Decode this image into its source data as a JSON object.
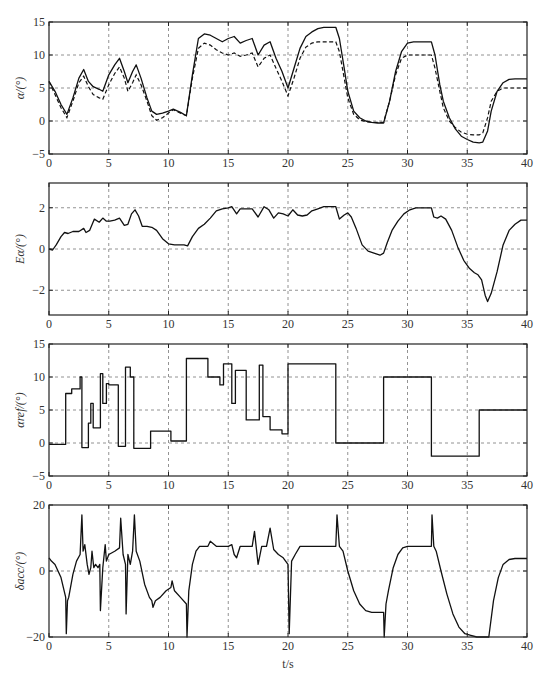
{
  "chart_data": [
    {
      "type": "line",
      "ylabel": "α/(°)",
      "xlabel": "",
      "xlim": [
        0,
        40
      ],
      "ylim": [
        -5,
        15
      ],
      "xticks": [
        0,
        5,
        10,
        15,
        20,
        25,
        30,
        35,
        40
      ],
      "yticks": [
        -5,
        0,
        5,
        10,
        15
      ],
      "grid": true,
      "series": [
        {
          "name": "alpha (actual)",
          "style": "solid",
          "x": [
            0,
            0.5,
            1,
            1.5,
            2,
            2.5,
            2.9,
            3.3,
            3.7,
            4.2,
            4.5,
            5,
            5.5,
            5.9,
            6.3,
            6.6,
            7,
            7.3,
            7.7,
            8.2,
            8.6,
            9,
            9.5,
            10,
            10.4,
            11,
            11.5,
            12,
            12.5,
            13,
            13.5,
            14,
            14.5,
            15,
            15.5,
            16,
            16.5,
            17,
            17.5,
            18,
            18.5,
            19,
            19.5,
            20,
            20.5,
            21,
            21.5,
            22,
            22.5,
            23,
            24,
            24.3,
            24.7,
            25,
            25.5,
            26,
            26.5,
            27,
            27.5,
            28,
            28.5,
            29,
            29.5,
            30,
            30.5,
            31,
            32,
            32.3,
            32.7,
            33,
            33.5,
            34,
            34.5,
            35,
            35.5,
            36,
            36.3,
            36.7,
            37,
            37.5,
            38,
            38.5,
            39,
            40
          ],
          "y": [
            6,
            4.5,
            2.5,
            1.0,
            3.5,
            6.5,
            7.8,
            6.0,
            5.2,
            4.8,
            4.5,
            7.0,
            8.5,
            9.5,
            7.5,
            5.8,
            7.5,
            8.5,
            6.5,
            3.5,
            1.5,
            1.0,
            1.2,
            1.5,
            1.8,
            1.3,
            0.8,
            7.0,
            12.5,
            13.2,
            13.0,
            12.5,
            12.0,
            12.5,
            12.8,
            11.8,
            12.2,
            12.5,
            10.0,
            11.5,
            12.0,
            9.5,
            7.5,
            5.0,
            8.0,
            11.0,
            12.8,
            13.5,
            14.0,
            14.2,
            14.2,
            12.5,
            8.0,
            4.5,
            1.5,
            0.5,
            0.0,
            -0.2,
            -0.3,
            -0.3,
            3.0,
            7.5,
            10.5,
            11.8,
            12.0,
            12.0,
            12.0,
            10.0,
            5.5,
            3.0,
            0.5,
            -1.2,
            -2.3,
            -2.8,
            -3.2,
            -3.3,
            -3.2,
            -1.5,
            1.5,
            4.5,
            5.8,
            6.3,
            6.4,
            6.4
          ]
        },
        {
          "name": "alpha (reference/model)",
          "style": "dashed",
          "x": [
            0,
            0.5,
            1,
            1.5,
            2,
            2.5,
            2.9,
            3.3,
            3.7,
            4.2,
            4.5,
            5,
            5.5,
            5.9,
            6.3,
            6.6,
            7,
            7.3,
            7.7,
            8.2,
            8.6,
            9,
            9.5,
            10,
            10.4,
            11,
            11.5,
            12,
            12.5,
            13,
            13.5,
            14,
            14.5,
            15,
            15.5,
            16,
            16.5,
            17,
            17.5,
            18,
            18.5,
            19,
            19.5,
            20,
            20.5,
            21,
            21.5,
            22,
            22.5,
            23,
            24,
            24.3,
            24.7,
            25,
            25.5,
            26,
            26.5,
            27,
            27.5,
            28,
            28.5,
            29,
            29.5,
            30,
            30.5,
            31,
            32,
            32.3,
            32.7,
            33,
            33.5,
            34,
            34.5,
            35,
            35.5,
            36,
            36.3,
            36.7,
            37,
            37.5,
            38,
            38.5,
            39,
            40
          ],
          "y": [
            6,
            4.0,
            2.0,
            0.5,
            3.0,
            5.8,
            6.8,
            5.2,
            4.0,
            3.5,
            3.3,
            5.5,
            7.2,
            8.2,
            6.5,
            4.5,
            5.8,
            7.0,
            5.5,
            3.0,
            0.8,
            0.1,
            0.5,
            1.2,
            1.7,
            1.2,
            0.8,
            6.5,
            11.0,
            11.8,
            11.5,
            10.8,
            10.3,
            10.0,
            10.3,
            9.8,
            10.0,
            10.3,
            8.2,
            9.5,
            10.0,
            8.0,
            6.0,
            3.8,
            6.5,
            9.5,
            11.2,
            11.8,
            12.0,
            12.0,
            12.0,
            10.5,
            6.5,
            3.5,
            1.0,
            0.2,
            -0.1,
            -0.2,
            -0.2,
            -0.2,
            3.0,
            7.0,
            9.5,
            10.0,
            10.0,
            10.0,
            10.0,
            8.0,
            4.5,
            2.0,
            0.0,
            -1.0,
            -1.7,
            -2.0,
            -2.1,
            -2.1,
            -1.8,
            0.5,
            3.0,
            4.5,
            5.0,
            5.0,
            5.0,
            5.0
          ]
        }
      ]
    },
    {
      "type": "line",
      "ylabel": "Eα/(°)",
      "xlabel": "",
      "xlim": [
        0,
        40
      ],
      "ylim": [
        -3.2,
        3.2
      ],
      "xticks": [
        0,
        5,
        10,
        15,
        20,
        25,
        30,
        35,
        40
      ],
      "yticks": [
        -2,
        0,
        2
      ],
      "grid": true,
      "series": [
        {
          "name": "alpha error",
          "style": "solid",
          "x": [
            0,
            0.3,
            0.6,
            1,
            1.3,
            1.6,
            2,
            2.5,
            2.9,
            3.1,
            3.4,
            3.8,
            4.2,
            4.5,
            4.8,
            5.1,
            5.5,
            5.9,
            6.3,
            6.6,
            6.9,
            7.2,
            7.5,
            7.8,
            8.2,
            8.6,
            9,
            9.5,
            10,
            10.5,
            11,
            11.3,
            11.6,
            12,
            12.5,
            13,
            13.5,
            14,
            14.5,
            15,
            15.3,
            15.7,
            16,
            16.5,
            17,
            17.5,
            18,
            18.4,
            18.8,
            19.2,
            19.6,
            20,
            20.4,
            20.8,
            21.2,
            21.6,
            22,
            22.5,
            23,
            23.5,
            24,
            24.3,
            24.7,
            25,
            25.3,
            25.7,
            26.2,
            26.7,
            27.2,
            27.7,
            28,
            28.3,
            28.7,
            29.2,
            29.7,
            30.2,
            30.7,
            31.3,
            32,
            32.2,
            32.5,
            32.8,
            33.2,
            33.7,
            34.2,
            34.7,
            35.2,
            35.6,
            35.9,
            36.2,
            36.5,
            36.7,
            37,
            37.5,
            38,
            38.5,
            39,
            39.5,
            40
          ],
          "y": [
            0.0,
            -0.05,
            0.2,
            0.6,
            0.8,
            0.75,
            0.85,
            0.85,
            1.0,
            0.8,
            0.9,
            1.45,
            1.3,
            1.5,
            1.35,
            1.35,
            1.4,
            1.5,
            1.15,
            1.2,
            1.7,
            1.9,
            1.6,
            1.1,
            1.1,
            1.05,
            0.9,
            0.5,
            0.25,
            0.2,
            0.2,
            0.2,
            0.15,
            0.6,
            1.0,
            1.2,
            1.5,
            1.85,
            1.95,
            2.0,
            2.05,
            1.7,
            1.95,
            1.95,
            1.95,
            1.55,
            2.05,
            1.9,
            1.5,
            1.75,
            1.7,
            1.6,
            1.9,
            1.65,
            1.6,
            1.65,
            1.85,
            1.95,
            2.05,
            2.05,
            2.05,
            1.45,
            1.65,
            1.75,
            1.55,
            1.0,
            0.2,
            -0.1,
            -0.2,
            -0.3,
            -0.2,
            0.3,
            0.9,
            1.35,
            1.7,
            1.9,
            2.0,
            2.0,
            2.0,
            1.55,
            1.5,
            1.6,
            1.45,
            0.9,
            0.1,
            -0.55,
            -0.95,
            -1.15,
            -1.25,
            -1.5,
            -2.25,
            -2.55,
            -2.15,
            -1.1,
            0.2,
            0.9,
            1.2,
            1.4,
            1.4
          ]
        }
      ]
    },
    {
      "type": "line",
      "step": true,
      "ylabel": "αref/(°)",
      "xlabel": "",
      "xlim": [
        0,
        40
      ],
      "ylim": [
        -5,
        15
      ],
      "xticks": [
        0,
        5,
        10,
        15,
        20,
        25,
        30,
        35,
        40
      ],
      "yticks": [
        -5,
        0,
        5,
        10,
        15
      ],
      "grid": true,
      "series": [
        {
          "name": "alpha reference",
          "style": "solid-step",
          "x": [
            0,
            1.4,
            1.9,
            2.6,
            2.75,
            3.3,
            3.5,
            3.7,
            4.3,
            4.5,
            4.8,
            5,
            5.8,
            6.4,
            6.8,
            7.1,
            8.5,
            10.2,
            11.5,
            13.3,
            14.3,
            14.6,
            15.3,
            15.6,
            16.5,
            17.6,
            17.9,
            18.5,
            19.5,
            20,
            24,
            28,
            32,
            36,
            40
          ],
          "y": [
            -0.2,
            7.5,
            8.2,
            10.0,
            -0.7,
            3.0,
            6.0,
            2.3,
            10.5,
            6.0,
            9.0,
            8.8,
            -0.5,
            11.5,
            10.0,
            -0.8,
            1.8,
            0.3,
            12.8,
            10.0,
            8.8,
            12.0,
            6.0,
            11.0,
            3.5,
            11.8,
            4.0,
            2.0,
            1.4,
            12.0,
            0.0,
            10.0,
            -2.0,
            5.0,
            5.0
          ]
        }
      ]
    },
    {
      "type": "line",
      "ylabel": "δacc/(°)",
      "xlabel": "t/s",
      "xlim": [
        0,
        40
      ],
      "ylim": [
        -20,
        20
      ],
      "xticks": [
        0,
        5,
        10,
        15,
        20,
        25,
        30,
        35,
        40
      ],
      "yticks": [
        -20,
        0,
        20
      ],
      "grid": true,
      "series": [
        {
          "name": "control deflection",
          "style": "solid",
          "x": [
            0,
            0.2,
            0.5,
            1,
            1.4,
            1.45,
            1.55,
            1.65,
            2,
            2.3,
            2.6,
            2.75,
            2.85,
            3,
            3.2,
            3.35,
            3.5,
            3.6,
            3.75,
            3.9,
            4.1,
            4.25,
            4.3,
            4.5,
            4.7,
            4.8,
            5,
            5.5,
            5.9,
            6.0,
            6.2,
            6.4,
            6.45,
            6.6,
            6.8,
            7.0,
            7.15,
            7.3,
            7.6,
            8.0,
            8.4,
            8.6,
            8.7,
            8.9,
            9.3,
            9.8,
            10.2,
            10.3,
            10.5,
            11.0,
            11.5,
            11.55,
            11.7,
            12.0,
            12.3,
            12.6,
            13,
            13.3,
            13.5,
            14.0,
            14.5,
            15.0,
            15.3,
            15.5,
            15.7,
            16.0,
            16.5,
            17.0,
            17.2,
            17.5,
            17.8,
            18.2,
            18.5,
            18.8,
            19.2,
            19.6,
            20.0,
            20.1,
            20.3,
            20.6,
            21.0,
            21.5,
            22.0,
            23.0,
            24.0,
            24.1,
            24.3,
            24.6,
            25.0,
            25.5,
            26.0,
            26.5,
            27.0,
            27.5,
            28.0,
            28.05,
            28.2,
            28.4,
            28.8,
            29.2,
            29.6,
            30.0,
            31.0,
            32.0,
            32.05,
            32.2,
            32.4,
            32.8,
            33.3,
            33.8,
            34.3,
            34.8,
            35.3,
            35.8,
            36.2,
            36.5,
            36.8,
            37.2,
            37.6,
            38.0,
            38.5,
            39.0,
            40.0
          ],
          "y": [
            4,
            3,
            2,
            -2,
            -8,
            -19,
            -9,
            -8,
            -1,
            3,
            5,
            17,
            6,
            8,
            2,
            -1,
            1,
            6,
            1,
            2,
            1,
            2,
            -12,
            1,
            8,
            3,
            5,
            6,
            7,
            16,
            5,
            2,
            -13,
            5,
            2,
            6,
            17,
            6,
            3,
            -4,
            -8,
            -9,
            -11,
            -9,
            -8,
            -6,
            -5,
            -3,
            -6,
            -8,
            -10,
            -20,
            -6,
            2,
            6,
            7.5,
            7.5,
            7.5,
            9,
            7.5,
            7.5,
            7.5,
            8,
            5,
            4,
            7.5,
            7.5,
            7.5,
            12,
            2,
            7.5,
            7.5,
            13,
            6.5,
            5,
            4,
            2,
            -19,
            3,
            5,
            7.5,
            7.5,
            7.5,
            7.5,
            7.5,
            17,
            7.5,
            6,
            0,
            -6,
            -10,
            -12,
            -12.5,
            -12.5,
            -12.5,
            -20,
            -10,
            -6,
            1,
            5,
            7,
            7.5,
            7.5,
            7.5,
            17,
            7.5,
            6,
            0,
            -7,
            -13,
            -17,
            -19,
            -19.5,
            -20,
            -20,
            -20,
            -20,
            -9,
            -2,
            2,
            3.5,
            3.8,
            3.8
          ]
        }
      ]
    }
  ],
  "axes_labels": {
    "p1_ylabel": "α/(°)",
    "p2_ylabel": "Eα/(°)",
    "p3_ylabel": "αref/(°)",
    "p4_ylabel": "δacc/(°)",
    "xlabel": "t/s"
  }
}
